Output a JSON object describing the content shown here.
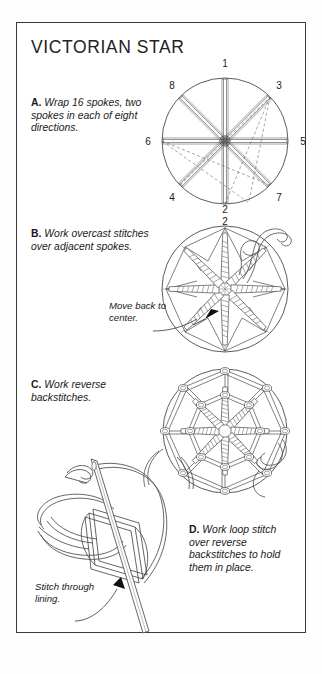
{
  "page": {
    "title": "VICTORIAN STAR",
    "background_color": "#ffffff",
    "border_color": "#3a3a3a",
    "ink_color": "#1a1a1a"
  },
  "steps": [
    {
      "id": "a",
      "letter": "A.",
      "text": "Wrap 16 spokes, two spokes in each of eight directions."
    },
    {
      "id": "b",
      "letter": "B.",
      "text": "Work overcast stitches over adjacent spokes."
    },
    {
      "id": "c",
      "letter": "C.",
      "text": "Work reverse backstitches."
    },
    {
      "id": "d",
      "letter": "D.",
      "text": "Work loop stitch over reverse backstitches to hold them in place."
    }
  ],
  "callouts": [
    {
      "id": "move-back",
      "text": "Move back to center."
    },
    {
      "id": "stitch-through",
      "text": "Stitch through lining."
    }
  ],
  "figures": {
    "a": {
      "name": "spoke-wrap-diagram",
      "spoke_numbers": [
        "1",
        "2",
        "3",
        "4",
        "5",
        "6",
        "7",
        "8"
      ],
      "label_positions": {
        "1": "top",
        "2": "bottom",
        "3": "upper-right",
        "4": "lower-left",
        "5": "right",
        "6": "left",
        "7": "lower-right",
        "8": "upper-left"
      },
      "spoke_count": 16,
      "direction_count": 8
    },
    "b": {
      "name": "overcast-star-diagram",
      "spoke_numbers": [
        "2"
      ],
      "label_positions": {
        "2": "top"
      }
    },
    "c": {
      "name": "reverse-backstitch-diagram",
      "spoke_numbers": [],
      "label_positions": {}
    },
    "d": {
      "name": "loop-stitch-detail-diagram",
      "spoke_numbers": [],
      "label_positions": {}
    }
  }
}
